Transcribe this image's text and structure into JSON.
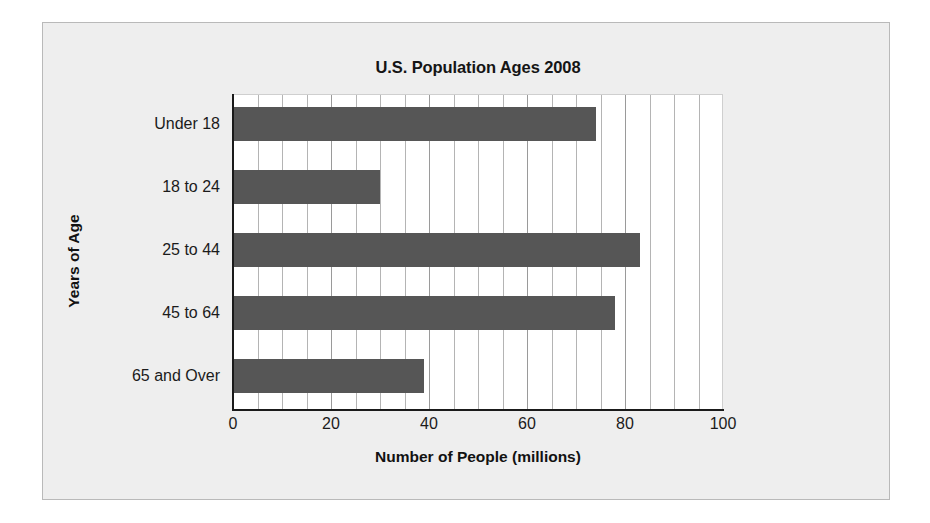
{
  "chart_data": {
    "type": "bar",
    "orientation": "horizontal",
    "title": "U.S. Population Ages 2008",
    "xlabel": "Number of People (millions)",
    "ylabel": "Years of Age",
    "categories": [
      "Under 18",
      "18 to 24",
      "25 to 44",
      "45 to 64",
      "65 and Over"
    ],
    "values": [
      74,
      30,
      83,
      78,
      39
    ],
    "xlim": [
      0,
      100
    ],
    "xticks": [
      0,
      20,
      40,
      60,
      80,
      100
    ],
    "xtick_labels": [
      "0",
      "20",
      "40",
      "60",
      "80",
      "100"
    ],
    "minor_tick_step": 5,
    "grid": "vertical",
    "legend": null,
    "series": [
      {
        "name": "Number of People (millions)",
        "values": [
          74,
          30,
          83,
          78,
          39
        ],
        "color": "#565656"
      }
    ]
  },
  "colors": {
    "bar": "#565656",
    "plot_background": "#ffffff",
    "card_background": "#eeeeee",
    "page_background": "#ffffff",
    "axis": "#1a1a1a",
    "gridline": "#b4b4b4",
    "text": "#1b1b1b"
  }
}
